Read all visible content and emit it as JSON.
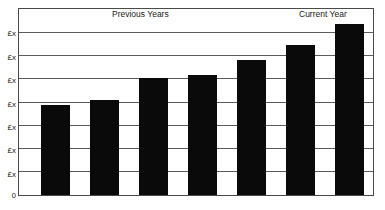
{
  "chart_data": {
    "type": "bar",
    "title": "",
    "subtitle": "",
    "xlabel": "",
    "ylabel": "",
    "grid": true,
    "legend_position": "none",
    "categories": [
      "",
      "",
      "",
      "",
      "",
      "",
      ""
    ],
    "values": [
      3.9,
      4.1,
      5.05,
      5.2,
      5.85,
      6.5,
      7.4
    ],
    "ylim": [
      0,
      8
    ],
    "y_tick_values": [
      0,
      1,
      2,
      3,
      4,
      5,
      6,
      7
    ],
    "y_tick_labels": [
      "0",
      "£x",
      "£x",
      "£x",
      "£x",
      "£x",
      "£x",
      "£x"
    ],
    "bar_color": "#0a0a0a",
    "grid_color": "#5a5a5a",
    "frame_color": "#4a4a4a",
    "annotations": [
      {
        "text": "Previous Years",
        "target": "bars 1-6"
      },
      {
        "text": "Current Year",
        "target": "bar 7"
      }
    ]
  },
  "axis": {
    "y_labels": [
      "£x",
      "£x",
      "£x",
      "£x",
      "£x",
      "£x",
      "£x"
    ],
    "y_zero_label": "0"
  },
  "titles": {
    "previous_years": "Previous Years",
    "current_year": "Current Year"
  }
}
